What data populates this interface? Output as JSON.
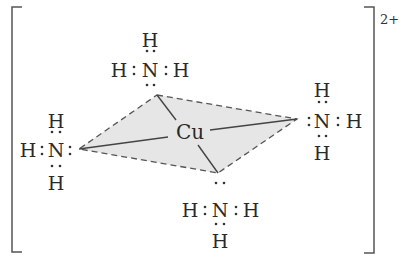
{
  "diagram": {
    "charge": "2+",
    "center_atom": {
      "label": "Cu",
      "x": 190,
      "y": 139
    },
    "colors": {
      "plane_fill": "#e6e6e6",
      "lines": "#4a4a4a",
      "text": "#2a2a2a"
    },
    "plane_vertices": [
      {
        "name": "top",
        "x": 157,
        "y": 95
      },
      {
        "name": "right",
        "x": 297,
        "y": 119
      },
      {
        "name": "bottom",
        "x": 218,
        "y": 173
      },
      {
        "name": "left",
        "x": 79,
        "y": 149
      }
    ],
    "ligands": [
      {
        "name": "top",
        "N": "N",
        "H": "H",
        "n_pos": {
          "x": 150,
          "y": 77
        },
        "h_positions": [
          {
            "x": 150,
            "y": 47
          },
          {
            "x": 119,
            "y": 77
          },
          {
            "x": 181,
            "y": 77
          }
        ]
      },
      {
        "name": "right",
        "N": "N",
        "H": "H",
        "n_pos": {
          "x": 322,
          "y": 128
        },
        "h_positions": [
          {
            "x": 322,
            "y": 97
          },
          {
            "x": 354,
            "y": 128
          },
          {
            "x": 322,
            "y": 160
          }
        ]
      },
      {
        "name": "left",
        "N": "N",
        "H": "H",
        "n_pos": {
          "x": 56,
          "y": 157
        },
        "h_positions": [
          {
            "x": 56,
            "y": 128
          },
          {
            "x": 28,
            "y": 157
          },
          {
            "x": 56,
            "y": 190
          }
        ]
      },
      {
        "name": "bottom",
        "N": "N",
        "H": "H",
        "n_pos": {
          "x": 220,
          "y": 217
        },
        "h_positions": [
          {
            "x": 190,
            "y": 217
          },
          {
            "x": 251,
            "y": 217
          },
          {
            "x": 220,
            "y": 248
          }
        ]
      }
    ]
  }
}
